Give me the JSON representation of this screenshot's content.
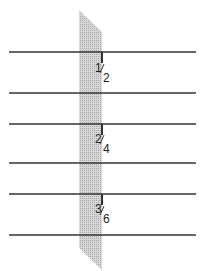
{
  "diagram": {
    "strip_color": "#c8c8c8",
    "line_color": "#333333",
    "fractions": [
      {
        "numerator": "1",
        "denominator": "2"
      },
      {
        "numerator": "2",
        "denominator": "4"
      },
      {
        "numerator": "3",
        "denominator": "6"
      }
    ]
  }
}
